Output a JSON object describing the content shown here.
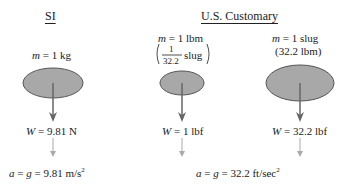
{
  "headings": {
    "si": "SI",
    "us": "U.S. Customary"
  },
  "si": {
    "mass_var": "m",
    "mass_val": " = 1 kg",
    "weight_var": "W",
    "weight_val": " = 9.81 N",
    "accel_var": "a",
    "accel_eq": " = ",
    "accel_g": "g",
    "accel_val": " = 9.81 m/s",
    "accel_exp": "2"
  },
  "us_lbm": {
    "mass_var": "m",
    "mass_val": " = 1 lbm",
    "frac_num": "1",
    "frac_den": "32.2",
    "frac_unit": "slug",
    "weight_var": "W",
    "weight_val": " = 1 lbf"
  },
  "us_slug": {
    "mass_var": "m",
    "mass_val": " = 1 slug",
    "mass_alt": "(32.2 lbm)",
    "weight_var": "W",
    "weight_val": " = 32.2 lbf"
  },
  "us_accel": {
    "accel_var": "a",
    "accel_eq": " = ",
    "accel_g": "g",
    "accel_val": " = 32.2 ft/sec",
    "accel_exp": "2"
  },
  "colors": {
    "mass_fill": "#a8a8a8",
    "mass_stroke": "#555555",
    "arrow": "#666666",
    "dashed_arrow": "#9a9a9a"
  }
}
